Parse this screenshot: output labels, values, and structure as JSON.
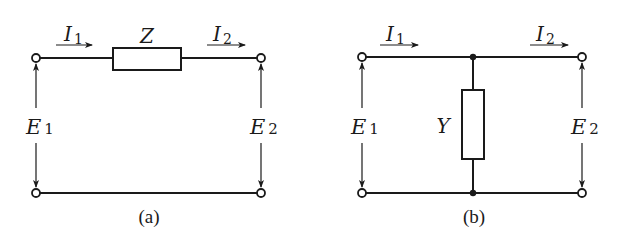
{
  "diagram": {
    "type": "two-port-network-equivalents",
    "panels": [
      {
        "caption": "(a)",
        "element": {
          "label": "Z",
          "kind": "series-impedance"
        },
        "currents": [
          {
            "symbol": "I",
            "sub": "1",
            "direction": "right"
          },
          {
            "symbol": "I",
            "sub": "2",
            "direction": "right"
          }
        ],
        "voltages": [
          {
            "symbol": "E",
            "sub": "1",
            "side": "input"
          },
          {
            "symbol": "E",
            "sub": "2",
            "side": "output"
          }
        ]
      },
      {
        "caption": "(b)",
        "element": {
          "label": "Y",
          "kind": "shunt-admittance"
        },
        "currents": [
          {
            "symbol": "I",
            "sub": "1",
            "direction": "right"
          },
          {
            "symbol": "I",
            "sub": "2",
            "direction": "right"
          }
        ],
        "voltages": [
          {
            "symbol": "E",
            "sub": "1",
            "side": "input"
          },
          {
            "symbol": "E",
            "sub": "2",
            "side": "output"
          }
        ]
      }
    ],
    "colors": {
      "ink": "#1a1a1a",
      "background": "#ffffff"
    }
  }
}
